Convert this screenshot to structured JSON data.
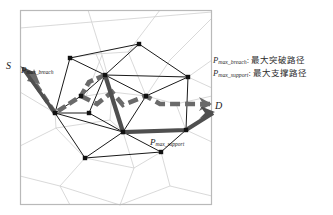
{
  "figure": {
    "title_none": "",
    "frame": {
      "x": 20,
      "y": 10,
      "w": 192,
      "h": 195,
      "color": "#b9b9b9"
    },
    "background": "#ffffff",
    "colors": {
      "voronoi_line": "#cfcfcf",
      "graph_edge": "#1a1a1a",
      "node_fill": "#111111",
      "breach_path": "#5a5a5a",
      "support_path": "#4a4a4a",
      "text": "#1a1a1a",
      "frame": "#b9b9b9"
    },
    "labels": {
      "source": "S",
      "destination": "D",
      "breach_label_sym": "P",
      "breach_label_sub": "max_breach",
      "support_label_sym": "P",
      "support_label_sub": "max_support"
    },
    "label_positions": {
      "source": {
        "x": 6,
        "y": 63
      },
      "destination": {
        "x": 214,
        "y": 102
      },
      "breach": {
        "x": 21,
        "y": 62
      },
      "support": {
        "x": 150,
        "y": 134
      }
    },
    "nodes": [
      {
        "id": "n1",
        "x": 70,
        "y": 58
      },
      {
        "id": "n2",
        "x": 139,
        "y": 44
      },
      {
        "id": "n3",
        "x": 188,
        "y": 77
      },
      {
        "id": "n4",
        "x": 105,
        "y": 75
      },
      {
        "id": "n5",
        "x": 55,
        "y": 113
      },
      {
        "id": "n6",
        "x": 81,
        "y": 96
      },
      {
        "id": "n7",
        "x": 89,
        "y": 113
      },
      {
        "id": "n8",
        "x": 123,
        "y": 132
      },
      {
        "id": "n9",
        "x": 186,
        "y": 130
      },
      {
        "id": "n10",
        "x": 85,
        "y": 158
      },
      {
        "id": "n11",
        "x": 161,
        "y": 152
      },
      {
        "id": "n12",
        "x": 146,
        "y": 96
      }
    ],
    "edges": [
      [
        "n1",
        "n2"
      ],
      [
        "n2",
        "n3"
      ],
      [
        "n1",
        "n4"
      ],
      [
        "n4",
        "n2"
      ],
      [
        "n4",
        "n3"
      ],
      [
        "n1",
        "n5"
      ],
      [
        "n5",
        "n6"
      ],
      [
        "n6",
        "n4"
      ],
      [
        "n5",
        "n7"
      ],
      [
        "n7",
        "n4"
      ],
      [
        "n5",
        "n8"
      ],
      [
        "n7",
        "n8"
      ],
      [
        "n4",
        "n8"
      ],
      [
        "n8",
        "n9"
      ],
      [
        "n3",
        "n9"
      ],
      [
        "n8",
        "n12"
      ],
      [
        "n12",
        "n3"
      ],
      [
        "n4",
        "n12"
      ],
      [
        "n5",
        "n10"
      ],
      [
        "n10",
        "n8"
      ],
      [
        "n8",
        "n11"
      ],
      [
        "n10",
        "n11"
      ],
      [
        "n11",
        "n9"
      ]
    ],
    "breach_path_nodes": [
      "n4",
      "n6",
      "n5"
    ],
    "support_path_nodes": [
      "n4",
      "n8",
      "n9"
    ],
    "paths": {
      "breach_style": "dashed",
      "support_style": "solid"
    }
  },
  "legend": {
    "items": [
      {
        "sym": "P",
        "sub": "max_breach",
        "sep": ": ",
        "text": "最大突破路径"
      },
      {
        "sym": "P",
        "sub": "max_support",
        "sep": ": ",
        "text": "最大支撑路径"
      }
    ]
  }
}
